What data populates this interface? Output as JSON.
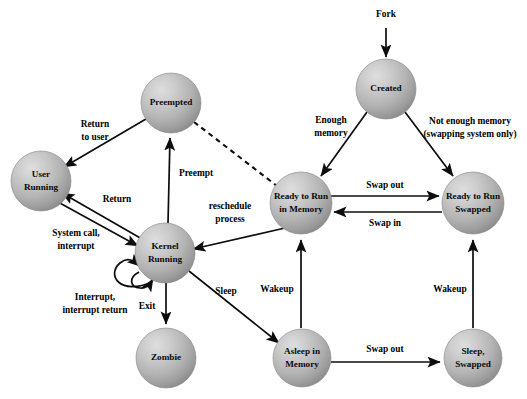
{
  "diagram": {
    "canvas": {
      "width": 527,
      "height": 399
    },
    "style": {
      "background": "#ffffff",
      "node_fill_light": "#cfcfcf",
      "node_fill_dark": "#8d8d8d",
      "node_edge": "#7a7a7a",
      "line_color": "#0d0d0d",
      "text_color": "#000000"
    },
    "nodes": [
      {
        "id": "created",
        "label_lines": [
          "Created"
        ],
        "cx": 386,
        "cy": 89,
        "r": 30
      },
      {
        "id": "preempted",
        "label_lines": [
          "Preempted"
        ],
        "cx": 171,
        "cy": 103,
        "r": 30
      },
      {
        "id": "user_running",
        "label_lines": [
          "User",
          "Running"
        ],
        "cx": 41,
        "cy": 181,
        "r": 30
      },
      {
        "id": "ready_memory",
        "label_lines": [
          "Ready to Run",
          "in Memory"
        ],
        "cx": 301,
        "cy": 203,
        "r": 31
      },
      {
        "id": "ready_swapped",
        "label_lines": [
          "Ready to Run",
          "Swapped"
        ],
        "cx": 473,
        "cy": 203,
        "r": 31
      },
      {
        "id": "kernel_running",
        "label_lines": [
          "Kernel",
          "Running"
        ],
        "cx": 165,
        "cy": 253,
        "r": 30
      },
      {
        "id": "zombie",
        "label_lines": [
          "Zombie"
        ],
        "cx": 166,
        "cy": 358,
        "r": 30
      },
      {
        "id": "asleep_memory",
        "label_lines": [
          "Asleep in",
          "Memory"
        ],
        "cx": 302,
        "cy": 358,
        "r": 29
      },
      {
        "id": "sleep_swapped",
        "label_lines": [
          "Sleep,",
          "Swapped"
        ],
        "cx": 473,
        "cy": 358,
        "r": 29
      }
    ],
    "edges": [
      {
        "id": "fork",
        "label_lines": [
          "Fork"
        ],
        "from": "external-top",
        "to": "created",
        "style": "solid"
      },
      {
        "id": "enough-memory",
        "label_lines": [
          "Enough",
          "memory"
        ],
        "from": "created",
        "to": "ready_memory",
        "style": "solid"
      },
      {
        "id": "not-enough-memory",
        "label_lines": [
          "Not enough memory",
          "(swapping system only)"
        ],
        "from": "created",
        "to": "ready_swapped",
        "style": "solid"
      },
      {
        "id": "return-to-user",
        "label_lines": [
          "Return",
          "to user"
        ],
        "from": "preempted",
        "to": "user_running",
        "style": "solid"
      },
      {
        "id": "preempt",
        "label_lines": [
          "Preempt"
        ],
        "from": "kernel_running",
        "to": "preempted",
        "style": "solid"
      },
      {
        "id": "reschedule",
        "label_lines": [
          "reschedule",
          "process"
        ],
        "from": "ready_memory",
        "to": "kernel_running",
        "style": "solid"
      },
      {
        "id": "preempted-dashed",
        "label_lines": [],
        "from": "preempted",
        "to": "ready_memory",
        "style": "dashed"
      },
      {
        "id": "return",
        "label_lines": [
          "Return"
        ],
        "from": "kernel_running",
        "to": "user_running",
        "style": "solid"
      },
      {
        "id": "system-call",
        "label_lines": [
          "System call,",
          "interrupt"
        ],
        "from": "user_running",
        "to": "kernel_running",
        "style": "solid"
      },
      {
        "id": "interrupt-loop",
        "label_lines": [
          "Interrupt,",
          "interrupt return"
        ],
        "from": "kernel_running",
        "to": "kernel_running",
        "style": "solid"
      },
      {
        "id": "exit",
        "label_lines": [
          "Exit"
        ],
        "from": "kernel_running",
        "to": "zombie",
        "style": "solid"
      },
      {
        "id": "sleep",
        "label_lines": [
          "Sleep"
        ],
        "from": "kernel_running",
        "to": "asleep_memory",
        "style": "solid"
      },
      {
        "id": "swap-out-ready",
        "label_lines": [
          "Swap out"
        ],
        "from": "ready_memory",
        "to": "ready_swapped",
        "style": "solid"
      },
      {
        "id": "swap-in",
        "label_lines": [
          "Swap in"
        ],
        "from": "ready_swapped",
        "to": "ready_memory",
        "style": "solid"
      },
      {
        "id": "wakeup-memory",
        "label_lines": [
          "Wakeup"
        ],
        "from": "asleep_memory",
        "to": "ready_memory",
        "style": "solid"
      },
      {
        "id": "wakeup-swapped",
        "label_lines": [
          "Wakeup"
        ],
        "from": "sleep_swapped",
        "to": "ready_swapped",
        "style": "solid"
      },
      {
        "id": "swap-out-sleep",
        "label_lines": [
          "Swap out"
        ],
        "from": "asleep_memory",
        "to": "sleep_swapped",
        "style": "solid"
      }
    ],
    "node_text": {
      "created": "Created",
      "preempted": "Preempted",
      "user_running_1": "User",
      "user_running_2": "Running",
      "ready_memory_1": "Ready to Run",
      "ready_memory_2": "in Memory",
      "ready_swapped_1": "Ready to Run",
      "ready_swapped_2": "Swapped",
      "kernel_running_1": "Kernel",
      "kernel_running_2": "Running",
      "zombie": "Zombie",
      "asleep_memory_1": "Asleep in",
      "asleep_memory_2": "Memory",
      "sleep_swapped_1": "Sleep,",
      "sleep_swapped_2": "Swapped"
    },
    "edge_text": {
      "fork": "Fork",
      "enough_memory_1": "Enough",
      "enough_memory_2": "memory",
      "not_enough_memory_1": "Not enough memory",
      "not_enough_memory_2": "(swapping system only)",
      "return_to_user_1": "Return",
      "return_to_user_2": "to user",
      "preempt": "Preempt",
      "reschedule_1": "reschedule",
      "reschedule_2": "process",
      "return": "Return",
      "system_call_1": "System call,",
      "system_call_2": "interrupt",
      "interrupt_loop_1": "Interrupt,",
      "interrupt_loop_2": "interrupt return",
      "exit": "Exit",
      "sleep": "Sleep",
      "swap_out_ready": "Swap out",
      "swap_in": "Swap in",
      "wakeup_memory": "Wakeup",
      "wakeup_swapped": "Wakeup",
      "swap_out_sleep": "Swap out"
    }
  }
}
